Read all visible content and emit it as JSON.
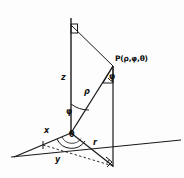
{
  "figure": {
    "type": "geometric-diagram",
    "stroke_color": "#1a1a1a",
    "background_color": "#ffffff",
    "labels": {
      "z_axis": "z",
      "x_axis": "x",
      "y_axis": "y",
      "radial_r": "r",
      "radial_rho": "ρ",
      "angle_phi_axis": "φ",
      "angle_phi_point": "φ",
      "angle_theta": "θ",
      "point": "P(ρ,φ,θ)"
    },
    "geometry": {
      "origin": [
        71,
        133
      ],
      "z_axis_top": [
        71,
        18
      ],
      "point_P": [
        113,
        66
      ],
      "foot_of_perpendicular": [
        113,
        165
      ],
      "x_axis_end": [
        14,
        157
      ],
      "plane_line_right_end": [
        181,
        140
      ],
      "plane_line_left_end": [
        11,
        157
      ],
      "dashed_y_end": [
        113,
        165
      ]
    },
    "right_angle_markers": [
      {
        "name": "top-z-axis",
        "at": [
          71,
          31
        ]
      },
      {
        "name": "bottom-foot",
        "at": [
          113,
          163
        ]
      }
    ]
  }
}
